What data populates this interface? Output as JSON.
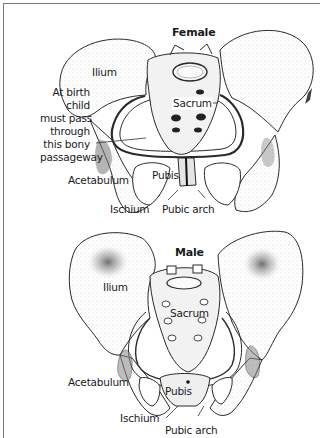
{
  "figure": {
    "panels": [
      {
        "id": "female",
        "title": "Female",
        "labels": {
          "ilium": "Ilium",
          "sacrum": "Sacrum",
          "pubis": "Pubis",
          "acetabulum": "Acetabulum",
          "ischium": "Ischium",
          "pubic_arch": "Pubic arch",
          "birth_note": [
            "At birth",
            "child",
            "must pass",
            "through",
            "this bony",
            "passageway"
          ]
        }
      },
      {
        "id": "male",
        "title": "Male",
        "labels": {
          "ilium": "Ilium",
          "sacrum": "Sacrum",
          "pubis": "Pubis",
          "acetabulum": "Acetabulum",
          "ischium": "Ischium",
          "pubic_arch": "Pubic arch"
        }
      }
    ],
    "colors": {
      "line": "#2a2a2a",
      "stipple": "#9a9a9a",
      "frame": "#777777",
      "background": "#ffffff"
    }
  }
}
